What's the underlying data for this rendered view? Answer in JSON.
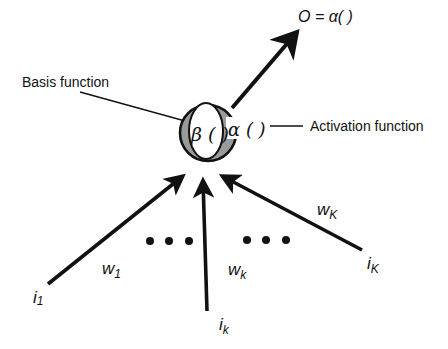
{
  "diagram": {
    "type": "neuron-node",
    "colors": {
      "stroke": "#111111",
      "shade": "#9a9a9a",
      "background": "#ffffff",
      "inner": "#ffffff"
    },
    "output_label": "O = α( )",
    "node": {
      "basis_symbol": "β ( )",
      "activation_symbol": "α ( )"
    },
    "callouts": {
      "basis": "Basis function",
      "activation": "Activation function"
    },
    "inputs": [
      {
        "input": "i",
        "input_sub": "1",
        "weight": "w",
        "weight_sub": "1"
      },
      {
        "input": "i",
        "input_sub": "k",
        "weight": "w",
        "weight_sub": "k"
      },
      {
        "input": "i",
        "input_sub": "K",
        "weight": "w",
        "weight_sub": "K"
      }
    ],
    "ellipsis": [
      "•",
      "•",
      "•",
      "•",
      "•",
      "•"
    ]
  }
}
